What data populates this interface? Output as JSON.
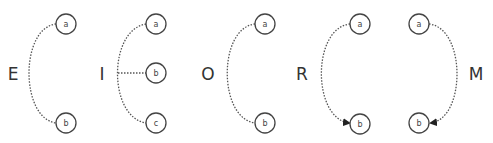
{
  "diagram": {
    "colors": {
      "stroke": "#444444",
      "text": "#333333",
      "background": "#ffffff"
    },
    "groups": [
      {
        "label": "E",
        "nodes": [
          "a",
          "b"
        ],
        "connection": "undirected dotted arc"
      },
      {
        "label": "I",
        "nodes": [
          "a",
          "b",
          "c"
        ],
        "connection": "undirected dotted arc with branch to b"
      },
      {
        "label": "O",
        "nodes": [
          "a",
          "b"
        ],
        "connection": "undirected dotted arc"
      },
      {
        "label": "R",
        "nodes": [
          "a",
          "b"
        ],
        "connection": "directed dotted arc a to b (arrow at b)"
      },
      {
        "label": "M",
        "nodes": [
          "a",
          "b"
        ],
        "connection": "directed dotted arc a to b on right side (arrow at b)"
      }
    ]
  }
}
